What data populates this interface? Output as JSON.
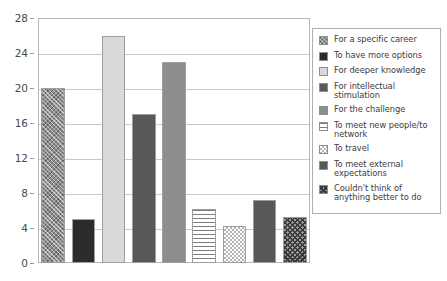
{
  "chart_data": {
    "type": "bar",
    "title": "",
    "subtitle": "",
    "xlabel": "",
    "ylabel": "",
    "ylim": [
      0,
      28
    ],
    "yticks": [
      0,
      4,
      8,
      12,
      16,
      20,
      24,
      28
    ],
    "ytick_labels": [
      "0",
      "4",
      "8",
      "12",
      "16",
      "20",
      "24",
      "28"
    ],
    "grid": true,
    "grid_axis": "y",
    "legend_position": "right",
    "xtick_labels": [],
    "categories": [
      "For a specific career",
      "To have more options",
      "For deeper knowledge",
      "For intellectual stimulation",
      "For the challenge",
      "To meet new people/to network",
      "To travel",
      "To meet external expectations",
      "Couldn't think of anything better to do"
    ],
    "values": [
      20,
      5,
      26,
      17,
      23,
      6.2,
      4.2,
      7.2,
      5.3
    ],
    "bar_styles": [
      "crosshatch-gray",
      "solid-black",
      "solid-lightgray",
      "solid-darkgray",
      "solid-midgray",
      "horizontal-lines",
      "checker-light",
      "solid-darkgray",
      "diag-dark"
    ],
    "colors": {
      "crosshatch-gray": "#8e8e8e",
      "solid-black": "#2c2c2c",
      "solid-lightgray": "#d9d9d9",
      "solid-darkgray": "#585858",
      "solid-midgray": "#8d8d8d",
      "horizontal-lines": "#7d7d7d",
      "checker-light": "#b4b4b4",
      "diag-dark": "#3b3b3b",
      "gridline": "#c9c9c9",
      "frame": "#b8b8b8",
      "text": "#3a3a3a"
    }
  },
  "legend": {
    "items": [
      {
        "label": "For a specific career",
        "style": "crosshatch-gray"
      },
      {
        "label": "To have more options",
        "style": "solid-black"
      },
      {
        "label": "For deeper knowledge",
        "style": "solid-lightgray"
      },
      {
        "label": "For intellectual stimulation",
        "style": "solid-darkgray"
      },
      {
        "label": "For the challenge",
        "style": "solid-midgray"
      },
      {
        "label": "To meet new people/to network",
        "style": "horizontal-lines"
      },
      {
        "label": "To travel",
        "style": "checker-light"
      },
      {
        "label": "To meet external expectations",
        "style": "solid-darkgray"
      },
      {
        "label": "Couldn't think of anything better to do",
        "style": "diag-dark"
      }
    ]
  }
}
